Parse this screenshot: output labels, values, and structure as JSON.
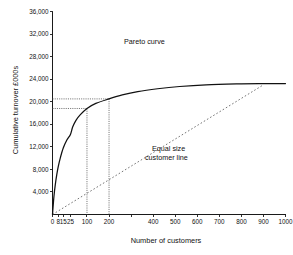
{
  "chart_data": {
    "type": "line",
    "title": "",
    "xlabel": "Number of customers",
    "ylabel": "Cumulative turnover £000s",
    "grid": false,
    "legend_position": "inline-annotations",
    "xlim": [
      0,
      1000
    ],
    "ylim": [
      0,
      36000
    ],
    "x_scale": "nonlinear-compressed",
    "x_ticks": [
      {
        "value": 0,
        "label": "0"
      },
      {
        "value": 8,
        "label": "8"
      },
      {
        "value": 15,
        "label": "15"
      },
      {
        "value": 25,
        "label": "25"
      },
      {
        "value": 100,
        "label": "100"
      },
      {
        "value": 200,
        "label": "200"
      },
      {
        "value": 300,
        "label": ""
      },
      {
        "value": 400,
        "label": "400"
      },
      {
        "value": 500,
        "label": "500"
      },
      {
        "value": 600,
        "label": "600"
      },
      {
        "value": 700,
        "label": "700"
      },
      {
        "value": 800,
        "label": "800"
      },
      {
        "value": 900,
        "label": "900"
      },
      {
        "value": 1000,
        "label": "1000"
      }
    ],
    "y_ticks": [
      {
        "value": 4000,
        "label": "4,000"
      },
      {
        "value": 8000,
        "label": "8,000"
      },
      {
        "value": 12000,
        "label": "12,000"
      },
      {
        "value": 16000,
        "label": "16,000"
      },
      {
        "value": 20000,
        "label": "20,000"
      },
      {
        "value": 24000,
        "label": "24,000"
      },
      {
        "value": 28000,
        "label": "28,000"
      },
      {
        "value": 32000,
        "label": "32,000"
      },
      {
        "value": 36000,
        "label": "36,000"
      }
    ],
    "series": [
      {
        "name": "Pareto curve",
        "style": "solid",
        "color": "#111111",
        "points": [
          [
            0,
            0
          ],
          [
            2,
            3200
          ],
          [
            4,
            5400
          ],
          [
            6,
            7100
          ],
          [
            8,
            8500
          ],
          [
            11,
            10100
          ],
          [
            15,
            11800
          ],
          [
            20,
            13200
          ],
          [
            25,
            14200
          ],
          [
            35,
            15500
          ],
          [
            50,
            16700
          ],
          [
            70,
            17700
          ],
          [
            100,
            18800
          ],
          [
            140,
            19700
          ],
          [
            200,
            20500
          ],
          [
            260,
            21200
          ],
          [
            330,
            21800
          ],
          [
            420,
            22300
          ],
          [
            520,
            22700
          ],
          [
            640,
            23000
          ],
          [
            780,
            23150
          ],
          [
            900,
            23200
          ],
          [
            1000,
            23220
          ]
        ]
      },
      {
        "name": "Equal size customer line",
        "style": "dashed",
        "color": "#6e6e6e",
        "points": [
          [
            0,
            0
          ],
          [
            900,
            23000
          ]
        ]
      }
    ],
    "guides": [
      {
        "name": "guide-100-customers",
        "x": 100,
        "y": 18800,
        "description": "dotted lines from y axis to curve at 100 customers"
      },
      {
        "name": "guide-200-customers",
        "x": 200,
        "y": 20500,
        "description": "dotted lines from y axis to curve at 200 customers"
      }
    ],
    "annotations": [
      {
        "name": "pareto-curve-label",
        "text": "Pareto curve"
      },
      {
        "name": "equal-size-line-label-1",
        "text": "Equal size"
      },
      {
        "name": "equal-size-line-label-2",
        "text": "customer line"
      }
    ],
    "colors": {
      "axis": "#1a1a1a",
      "pareto": "#111111",
      "equal_line": "#6e6e6e",
      "guide": "#555555",
      "background": "#ffffff"
    }
  }
}
